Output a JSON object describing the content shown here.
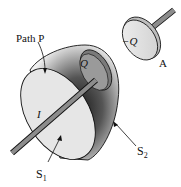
{
  "diagram": {
    "labels": {
      "path": "Path P",
      "charge_pos": "Q",
      "charge_neg": "−Q",
      "plate": "A",
      "current": "I",
      "surface1": "S",
      "surface1_sub": "1",
      "surface2": "S",
      "surface2_sub": "2"
    },
    "colors": {
      "surface_fill": "#e6e6e6",
      "rod": "#8c8c8c",
      "outline": "#111111"
    }
  }
}
